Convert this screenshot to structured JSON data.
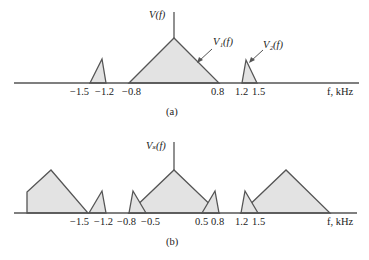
{
  "panel_a": {
    "ylabel": "V(f)",
    "v1_label": "V₁(f)",
    "v2_label": "V₂(f)",
    "ticks": [
      "−1.5",
      "−1.2",
      "−0.8",
      "0.8",
      "1.2",
      "1.5"
    ],
    "xlabel": "f, kHz",
    "caption": "(a)"
  },
  "panel_b": {
    "ylabel": "Vₛ(f)",
    "ticks": [
      "−1.5",
      "−1.2",
      "−0.8",
      "−0.5",
      "0.5",
      "0.8",
      "1.2",
      "1.5"
    ],
    "xlabel": "f, kHz",
    "caption": "(b)"
  },
  "colors": {
    "fill": "#e3e3e3",
    "line": "#555555"
  }
}
